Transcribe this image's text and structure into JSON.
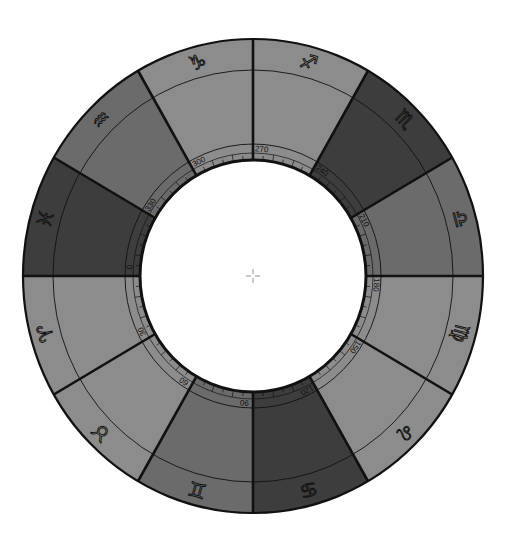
{
  "wheel": {
    "center": [
      253,
      276
    ],
    "outer_radius": [
      230,
      237
    ],
    "sign_ring_radius": [
      200,
      206
    ],
    "label_ring_radius": [
      128,
      132
    ],
    "inner_radius": [
      113,
      116
    ],
    "colors": {
      "light": "#8c8c8c",
      "medium": "#6b6b6b",
      "dark": "#3d3d3d",
      "line": "#111111",
      "center_fill": "#ffffff"
    },
    "segments": [
      {
        "name": "Capricorn",
        "glyph": "♑",
        "start_angle": 90,
        "end_angle": 120,
        "tone": "light",
        "degree_label": "270"
      },
      {
        "name": "Aquarius",
        "glyph": "♒",
        "start_angle": 120,
        "end_angle": 150,
        "tone": "medium",
        "degree_label": "300"
      },
      {
        "name": "Pisces",
        "glyph": "♓",
        "start_angle": 150,
        "end_angle": 180,
        "tone": "dark",
        "degree_label": "330"
      },
      {
        "name": "Aries",
        "glyph": "♈",
        "start_angle": 180,
        "end_angle": 210,
        "tone": "light",
        "degree_label": "0"
      },
      {
        "name": "Taurus",
        "glyph": "♉",
        "start_angle": 210,
        "end_angle": 240,
        "tone": "light",
        "degree_label": "30"
      },
      {
        "name": "Gemini",
        "glyph": "♊",
        "start_angle": 240,
        "end_angle": 270,
        "tone": "medium",
        "degree_label": "60"
      },
      {
        "name": "Cancer",
        "glyph": "♋",
        "start_angle": 270,
        "end_angle": 300,
        "tone": "dark",
        "degree_label": "90"
      },
      {
        "name": "Leo",
        "glyph": "♌",
        "start_angle": 300,
        "end_angle": 330,
        "tone": "light",
        "degree_label": "120"
      },
      {
        "name": "Virgo",
        "glyph": "♍",
        "start_angle": 330,
        "end_angle": 360,
        "tone": "light",
        "degree_label": "150"
      },
      {
        "name": "Libra",
        "glyph": "♎",
        "start_angle": 0,
        "end_angle": 30,
        "tone": "medium",
        "degree_label": "180"
      },
      {
        "name": "Scorpio",
        "glyph": "♏",
        "start_angle": 30,
        "end_angle": 60,
        "tone": "dark",
        "degree_label": "210"
      },
      {
        "name": "Sagittarius",
        "glyph": "♐",
        "start_angle": 60,
        "end_angle": 90,
        "tone": "light",
        "degree_label": "240"
      }
    ],
    "center_marker": "crosshair-icon"
  }
}
